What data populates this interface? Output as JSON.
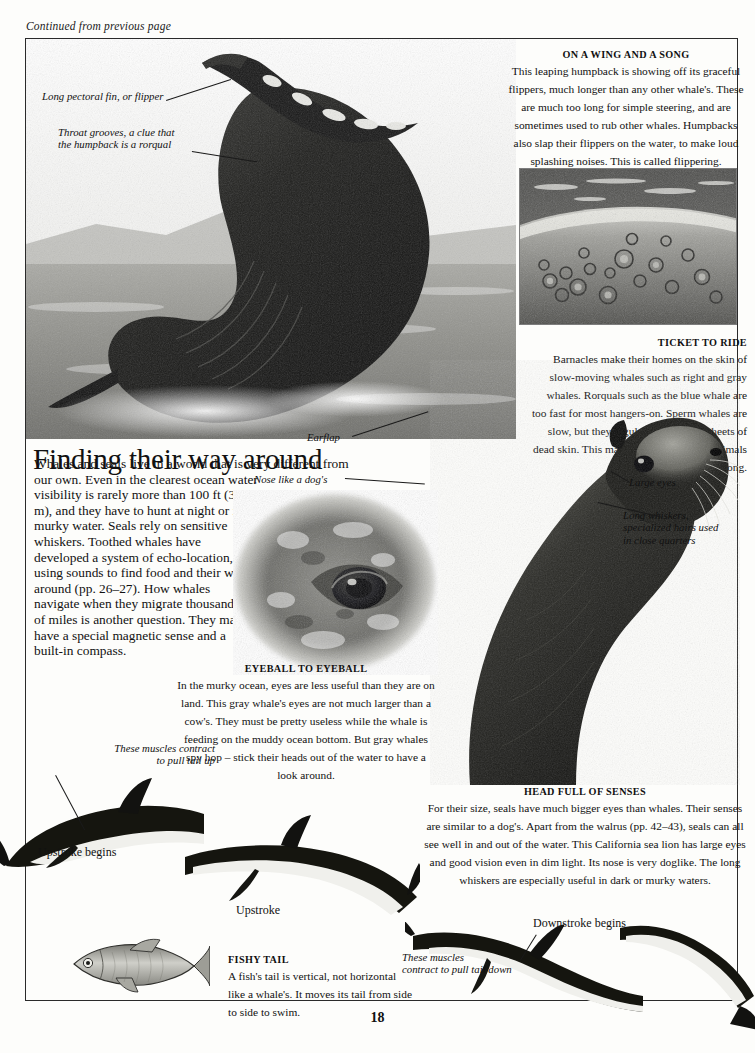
{
  "page": {
    "continued_note": "Continued from previous page",
    "page_number": "18"
  },
  "headline": "Finding their way around",
  "intro": {
    "wide_part": "Whales and seals live in a world that is very different from our own. Even in the clearest ocean water",
    "narrow_part": "visibility is rarely more than 100 ft (30 m), and they have to hunt at night or in murky water. Seals rely on sensitive whiskers. Toothed whales have developed a system of echo-location, using sounds to find food and their way around (pp. 26–27). How whales navigate when they migrate thousands of miles is another question. They may have a special magnetic sense and a built-in compass."
  },
  "captions": {
    "wing_song": {
      "title": "ON A WING AND A SONG",
      "body": "This leaping humpback is showing off its graceful flippers, much longer than any other whale's. These are much too long for simple steering, and are sometimes used to rub other whales. Humpbacks also slap their flippers on the water, to make loud splashing noises. This is called flippering."
    },
    "ticket_ride": {
      "title": "TICKET TO RIDE",
      "body": "Barnacles make their homes on the skin of slow-moving whales such as right and gray whales. Rorquals such as the blue whale are too fast for most hangers-on. Sperm whales are slow, but they regularly shed huge sheets of dead skin. This makes it hard for other animals to hitch a free ride for long."
    },
    "eyeball": {
      "title": "EYEBALL TO EYEBALL",
      "body": "In the murky ocean, eyes are less useful than they are on land. This gray whale's eyes are not much larger than a cow's. They must be pretty useless while the whale is feeding on the muddy ocean bottom. But gray whales spy hop – stick their heads out of the water to have a look around."
    },
    "head_senses": {
      "title": "HEAD FULL OF SENSES",
      "body": "For their size, seals have much bigger eyes than whales. Their senses are similar to a dog's. Apart from the walrus (pp. 42–43), seals can all see well in and out of the water. This California sea lion has large eyes and good vision even in dim light. Its nose is very doglike. The long whiskers are especially useful in dark or murky waters."
    },
    "fishy_tail": {
      "title": "FISHY TAIL",
      "body": "A fish's tail is vertical, not horizontal like a whale's. It moves its tail from side to side to swim."
    }
  },
  "labels": {
    "pectoral_fin": "Long pectoral fin, or flipper",
    "throat_grooves": "Throat grooves, a clue that\nthe humpback is a rorqual",
    "earflap": "Earflap",
    "nose_like_dog": "Nose like a dog's",
    "large_eyes": "Large eyes",
    "long_whiskers": "Long whiskers,\nspecialized hairs used\nin close quarters",
    "muscles_up": "These muscles contract\nto pull tail up",
    "muscles_down": "These muscles\ncontract to pull tail down",
    "upstroke_begins": "Upstroke begins",
    "upstroke": "Upstroke",
    "downstroke_begins": "Downstroke begins"
  },
  "colors": {
    "ink": "#111111",
    "frame": "#2a2a2a",
    "paper": "#fdfdfb",
    "photo_dark": "#1b1b1b",
    "photo_mid": "#8a8a88",
    "photo_light": "#d8d8d4"
  }
}
